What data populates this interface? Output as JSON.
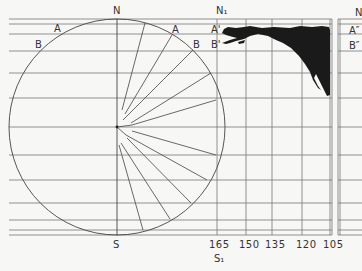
{
  "diagram": {
    "globe": {
      "north_label": "N",
      "south_label": "S",
      "left_a_label": "A",
      "left_b_label": "B",
      "right_a_label": "A",
      "right_b_label": "B"
    },
    "grid": {
      "north_label": "N₁",
      "south_label": "S₁",
      "a_label": "A'",
      "b_label": "B'",
      "longitude_ticks": [
        "165",
        "150",
        "135",
        "120",
        "105"
      ]
    },
    "next_panel": {
      "north_label": "N",
      "a_label": "A″",
      "b_label": "B″"
    },
    "colors": {
      "background": "#f7f7f5",
      "line": "#555555",
      "landmass": "#1a1a1a"
    }
  }
}
